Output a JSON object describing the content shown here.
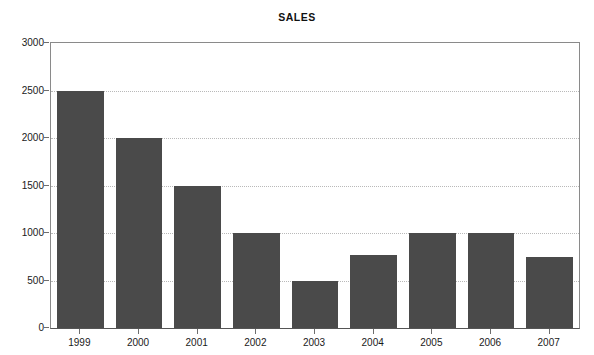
{
  "chart_data": {
    "type": "bar",
    "title": "SALES",
    "xlabel": "",
    "ylabel": "",
    "categories": [
      "1999",
      "2000",
      "2001",
      "2002",
      "2003",
      "2004",
      "2005",
      "2006",
      "2007"
    ],
    "values": [
      2500,
      2000,
      1500,
      1000,
      500,
      770,
      1000,
      1000,
      750
    ],
    "series": [
      {
        "name": "SALES",
        "values": [
          2500,
          2000,
          1500,
          1000,
          500,
          770,
          1000,
          1000,
          750
        ]
      }
    ],
    "ylim": [
      0,
      3000
    ],
    "y_ticks": [
      0,
      500,
      1000,
      1500,
      2000,
      2500,
      3000
    ],
    "y_tick_labels": [
      "0",
      "500",
      "1000",
      "1500",
      "2000",
      "2500",
      "3000"
    ],
    "grid": true,
    "grid_axis": "y",
    "legend": false,
    "legend_position": "none",
    "bar_color": "#4a4a4a",
    "grid_color": "#b9b9b9",
    "axis_color": "#6e6e6e",
    "background_color": "#ffffff",
    "text_color": "#1a1a1a"
  }
}
